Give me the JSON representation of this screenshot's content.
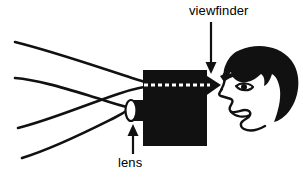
{
  "figure": {
    "background_color": "#ffffff",
    "ink_color": "#000000",
    "width": 303,
    "height": 180
  },
  "labels": {
    "viewfinder": "viewfinder",
    "lens": "lens"
  },
  "annotations": [
    {
      "name": "viewfinder-arrow",
      "label": "viewfinder",
      "direction": "down",
      "from": [
        211,
        22
      ],
      "to": [
        211,
        73
      ]
    },
    {
      "name": "lens-arrow",
      "label": "lens",
      "direction": "up",
      "from": [
        133,
        154
      ],
      "to": [
        133,
        125
      ]
    }
  ],
  "parts": {
    "camera_body": "camera-body",
    "lens": "camera-lens",
    "viewfinder": "camera-viewfinder",
    "sight_line": "dashed-sight-line",
    "head": "person-head",
    "rays": "field-of-view-rays"
  },
  "ray_count": 4
}
